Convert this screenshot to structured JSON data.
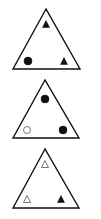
{
  "panels": [
    {
      "name": "triangle-panel-1",
      "outline": {
        "apex": [
          46,
          9
        ],
        "left": [
          13,
          69
        ],
        "right": [
          80,
          69
        ]
      },
      "symbols": [
        {
          "position": "top",
          "shape": "triangle",
          "fill": "filled",
          "cx": 46,
          "cy": 24
        },
        {
          "position": "bottom-left",
          "shape": "circle",
          "fill": "filled",
          "cx": 28,
          "cy": 61
        },
        {
          "position": "bottom-right",
          "shape": "triangle",
          "fill": "filled",
          "cx": 64,
          "cy": 61
        }
      ]
    },
    {
      "name": "triangle-panel-2",
      "outline": {
        "apex": [
          45,
          80
        ],
        "left": [
          13,
          138
        ],
        "right": [
          79,
          138
        ]
      },
      "symbols": [
        {
          "position": "top",
          "shape": "circle",
          "fill": "filled",
          "cx": 45,
          "cy": 99
        },
        {
          "position": "bottom-left",
          "shape": "circle",
          "fill": "outline",
          "cx": 27,
          "cy": 130
        },
        {
          "position": "bottom-right",
          "shape": "circle",
          "fill": "filled",
          "cx": 63,
          "cy": 130
        }
      ]
    },
    {
      "name": "triangle-panel-3",
      "outline": {
        "apex": [
          45,
          149
        ],
        "left": [
          13,
          208
        ],
        "right": [
          79,
          208
        ]
      },
      "symbols": [
        {
          "position": "top",
          "shape": "triangle",
          "fill": "outline",
          "cx": 45,
          "cy": 164
        },
        {
          "position": "bottom-left",
          "shape": "triangle",
          "fill": "outline",
          "cx": 27,
          "cy": 199
        },
        {
          "position": "bottom-right",
          "shape": "triangle",
          "fill": "filled",
          "cx": 61,
          "cy": 199
        }
      ]
    }
  ],
  "colors": {
    "stroke": "#111111",
    "fill": "#111111",
    "background": "#ffffff"
  }
}
